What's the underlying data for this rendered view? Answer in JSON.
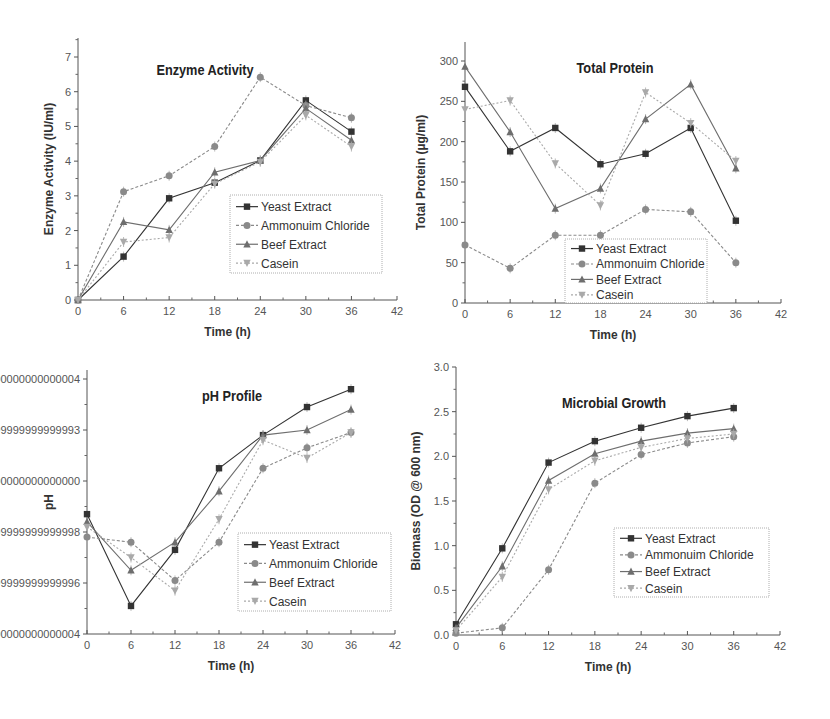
{
  "figure": {
    "series_names": [
      "Yeast Extract",
      "Ammonuim Chloride",
      "Beef Extract",
      "Casein"
    ],
    "series_styles": [
      {
        "marker": "square",
        "color": "#333333",
        "dash": ""
      },
      {
        "marker": "circle",
        "color": "#8a8a8a",
        "dash": "3,2"
      },
      {
        "marker": "triangle-up",
        "color": "#6e6e6e",
        "dash": ""
      },
      {
        "marker": "triangle-down",
        "color": "#a9a9a9",
        "dash": "2,2"
      }
    ]
  },
  "chart_data": [
    {
      "id": "enzyme",
      "type": "line",
      "title": "Enzyme Activity",
      "xlabel": "Time (h)",
      "ylabel": "Enzyme Activity (IU/ml)",
      "x": [
        0,
        6,
        12,
        18,
        24,
        30,
        36
      ],
      "xlim": [
        0,
        42
      ],
      "xticks": [
        0,
        6,
        12,
        18,
        24,
        30,
        36,
        42
      ],
      "ylim": [
        0,
        7.5
      ],
      "yticks": [
        0,
        1,
        2,
        3,
        4,
        5,
        6,
        7
      ],
      "grid": false,
      "legend_position": "lower right (inside)",
      "series": [
        {
          "name": "Yeast Extract",
          "values": [
            0,
            1.25,
            2.93,
            3.38,
            4.02,
            5.75,
            4.85
          ]
        },
        {
          "name": "Ammonuim Chloride",
          "values": [
            0,
            3.12,
            3.58,
            4.42,
            6.42,
            5.6,
            5.25
          ]
        },
        {
          "name": "Beef Extract",
          "values": [
            0,
            2.25,
            2.02,
            3.68,
            4.02,
            5.52,
            4.6
          ]
        },
        {
          "name": "Casein",
          "values": [
            0,
            1.67,
            1.8,
            3.35,
            3.98,
            5.32,
            4.42
          ]
        }
      ],
      "layout": {
        "x0": 78,
        "x1": 397,
        "y0": 300,
        "y1": 57,
        "yv0": 0,
        "yv1": 7,
        "ytop": 38,
        "title_x": 205,
        "title_y": 75,
        "legend": {
          "x": 230,
          "y": 195,
          "w": 152,
          "h": 78
        }
      }
    },
    {
      "id": "protein",
      "type": "line",
      "title": "Total Protein",
      "xlabel": "Time (h)",
      "ylabel": "Total Protein (µg/ml)",
      "x": [
        0,
        6,
        12,
        18,
        24,
        30,
        36
      ],
      "xlim": [
        0,
        42
      ],
      "xticks": [
        0,
        6,
        12,
        18,
        24,
        30,
        36,
        42
      ],
      "ylim": [
        0,
        325
      ],
      "yticks": [
        0,
        50,
        100,
        150,
        200,
        250,
        300
      ],
      "grid": false,
      "legend_position": "lower center (inside)",
      "series": [
        {
          "name": "Yeast Extract",
          "values": [
            268,
            188,
            217,
            172,
            185,
            217,
            102
          ]
        },
        {
          "name": "Ammonuim Chloride",
          "values": [
            72,
            43,
            84,
            84,
            116,
            113,
            50
          ]
        },
        {
          "name": "Beef Extract",
          "values": [
            293,
            212,
            117,
            142,
            228,
            271,
            167
          ]
        },
        {
          "name": "Casein",
          "values": [
            240,
            251,
            173,
            121,
            261,
            223,
            176
          ]
        }
      ],
      "layout": {
        "x0": 465,
        "x1": 781,
        "y0": 303,
        "y1": 61,
        "yv0": 0,
        "yv1": 300,
        "ytop": 42,
        "title_x": 615,
        "title_y": 73,
        "legend": {
          "x": 565,
          "y": 239,
          "w": 142,
          "h": 64
        }
      }
    },
    {
      "id": "ph",
      "type": "line",
      "title": "pH Profile",
      "xlabel": "Time (h)",
      "ylabel": "pH",
      "x": [
        0,
        6,
        12,
        18,
        24,
        30,
        36
      ],
      "xlim": [
        0,
        42
      ],
      "xticks": [
        0,
        6,
        12,
        18,
        24,
        30,
        36,
        42
      ],
      "ylim": [
        7.4,
        8.45
      ],
      "yticks": [
        7.4,
        7.6,
        7.8,
        8.0,
        8.2,
        8.4
      ],
      "grid": false,
      "legend_position": "center right (inside)",
      "series": [
        {
          "name": "Yeast Extract",
          "values": [
            7.87,
            7.51,
            7.73,
            8.05,
            8.18,
            8.29,
            8.36
          ]
        },
        {
          "name": "Ammonuim Chloride",
          "values": [
            7.78,
            7.76,
            7.61,
            7.76,
            8.05,
            8.13,
            8.19
          ]
        },
        {
          "name": "Beef Extract",
          "values": [
            7.84,
            7.65,
            7.76,
            7.96,
            8.18,
            8.2,
            8.28
          ]
        },
        {
          "name": "Casein",
          "values": [
            7.82,
            7.7,
            7.57,
            7.85,
            8.16,
            8.09,
            8.19
          ]
        }
      ],
      "layout": {
        "x0": 87,
        "x1": 395,
        "y0": 634,
        "y1": 379,
        "yv0": 7.4,
        "yv1": 8.4,
        "ytop": 370,
        "title_x": 232,
        "title_y": 401,
        "legend": {
          "x": 238,
          "y": 533,
          "w": 153,
          "h": 78
        }
      }
    },
    {
      "id": "growth",
      "type": "line",
      "title": "Microbial Growth",
      "xlabel": "Time (h)",
      "ylabel": "Biomass (OD @ 600 nm)",
      "x": [
        0,
        6,
        12,
        18,
        24,
        30,
        36
      ],
      "xlim": [
        0,
        42
      ],
      "xticks": [
        0,
        6,
        12,
        18,
        24,
        30,
        36,
        42
      ],
      "ylim": [
        0,
        3.0
      ],
      "yticks": [
        0.0,
        0.5,
        1.0,
        1.5,
        2.0,
        2.5,
        3.0
      ],
      "grid": false,
      "legend_position": "lower right (inside)",
      "series": [
        {
          "name": "Yeast Extract",
          "values": [
            0.12,
            0.97,
            1.93,
            2.17,
            2.32,
            2.45,
            2.54
          ]
        },
        {
          "name": "Ammonuim Chloride",
          "values": [
            0.02,
            0.08,
            0.73,
            1.7,
            2.02,
            2.15,
            2.22
          ]
        },
        {
          "name": "Beef Extract",
          "values": [
            0.08,
            0.77,
            1.73,
            2.03,
            2.17,
            2.26,
            2.31
          ]
        },
        {
          "name": "Casein",
          "values": [
            0.05,
            0.65,
            1.63,
            1.95,
            2.1,
            2.2,
            2.25
          ]
        }
      ],
      "layout": {
        "x0": 456,
        "x1": 780,
        "y0": 635,
        "y1": 367,
        "yv0": 0,
        "yv1": 3.0,
        "ytop": 367,
        "title_x": 614,
        "title_y": 408,
        "legend": {
          "x": 614,
          "y": 528,
          "w": 155,
          "h": 69
        }
      }
    }
  ]
}
